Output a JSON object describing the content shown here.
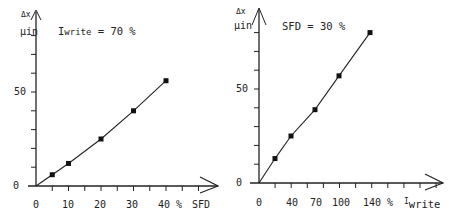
{
  "chart_data": [
    {
      "type": "line",
      "title": "",
      "annotation": "Iwrite = 70 %",
      "annotation_parts": {
        "prefix": "I",
        "sub": "write",
        "suffix": " = 70 %"
      },
      "xlabel": "SFD",
      "ylabel": "Δx µin",
      "ylabel_parts": {
        "top": "Δx",
        "bottom": "µin"
      },
      "x_tick_labels": [
        "0",
        "10",
        "20",
        "30",
        "40 %"
      ],
      "x_unit_label": "SFD",
      "y_tick_labels": [
        "0",
        "50"
      ],
      "xlim": [
        0,
        55
      ],
      "ylim": [
        0,
        80
      ],
      "grid": false,
      "x": [
        0,
        5,
        10,
        20,
        30,
        40
      ],
      "values": [
        0,
        6,
        12,
        25,
        40,
        56
      ],
      "marker": "square"
    },
    {
      "type": "line",
      "title": "",
      "annotation": "SFD = 30 %",
      "xlabel": "Iwrite",
      "xlabel_parts": {
        "prefix": "I",
        "sub": "write"
      },
      "ylabel": "Δx µin",
      "ylabel_parts": {
        "top": "Δx",
        "bottom": "µin"
      },
      "x_tick_labels": [
        "0",
        "40",
        "70",
        "100",
        "140 %"
      ],
      "y_tick_labels": [
        "0",
        "50"
      ],
      "xlim": [
        0,
        180
      ],
      "ylim": [
        0,
        85
      ],
      "grid": false,
      "x": [
        0,
        20,
        40,
        70,
        100,
        140
      ],
      "values": [
        0,
        13,
        25,
        39,
        57,
        80
      ],
      "marker": "square"
    }
  ]
}
